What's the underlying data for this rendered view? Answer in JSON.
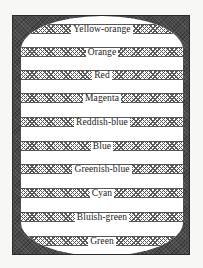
{
  "figure": {
    "type": "hue-band-diagram",
    "frame_color": "#4a4a4a",
    "background_color": "#ffffff",
    "bands": [
      {
        "label": "Yellow-orange",
        "center_y": 28
      },
      {
        "label": "Orange",
        "center_y": 51
      },
      {
        "label": "Red",
        "center_y": 74
      },
      {
        "label": "Magenta",
        "center_y": 97
      },
      {
        "label": "Reddish-blue",
        "center_y": 121
      },
      {
        "label": "Blue",
        "center_y": 145
      },
      {
        "label": "Greenish-blue",
        "center_y": 168
      },
      {
        "label": "Cyan",
        "center_y": 192
      },
      {
        "label": "Bluish-green",
        "center_y": 216
      },
      {
        "label": "Green",
        "center_y": 240
      }
    ]
  }
}
